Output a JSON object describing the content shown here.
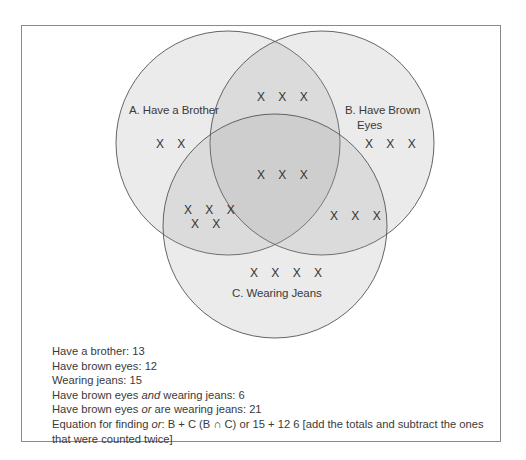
{
  "diagram": {
    "type": "venn",
    "sets": [
      {
        "id": "A",
        "label": "A. Have a Brother",
        "total": 13
      },
      {
        "id": "B",
        "label_line1": "B. Have Brown",
        "label_line2": "Eyes",
        "total": 12
      },
      {
        "id": "C",
        "label": "C. Wearing Jeans",
        "total": 15
      }
    ],
    "regions": {
      "A_only": "X X",
      "B_only": "X X X",
      "C_only": "X X X X",
      "A_and_B": "X X X",
      "A_and_C_line1": "X X X",
      "A_and_C_line2": "X X",
      "B_and_C": "X X X",
      "A_and_B_and_C": "X X X"
    },
    "region_counts": {
      "A_only": 2,
      "B_only": 3,
      "C_only": 4,
      "A_and_B": 3,
      "A_and_C": 5,
      "B_and_C": 3,
      "A_and_B_and_C": 3
    },
    "colors": {
      "stroke": "#555555",
      "fill": "#e6e6e6",
      "frame": "#8a8a8a"
    }
  },
  "notes": {
    "brother": "Have a brother: 13",
    "brown_eyes": "Have brown eyes: 12",
    "jeans": "Wearing jeans: 15",
    "and_prefix": "Have brown eyes ",
    "and_word": "and",
    "and_suffix": " wearing jeans: 6",
    "or_prefix": "Have brown eyes ",
    "or_word": "or",
    "or_suffix": " are wearing jeans: 21",
    "eq_prefix": "Equation for finding ",
    "eq_word": "or",
    "eq_suffix": ": B + C (B ∩ C) or 15 + 12 6 [add the totals and subtract the ones",
    "eq_line2": "that were counted twice]"
  }
}
